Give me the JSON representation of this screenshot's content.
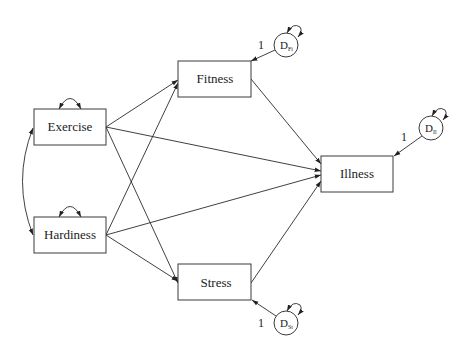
{
  "diagram": {
    "type": "path_diagram",
    "nodes": {
      "exercise": {
        "label": "Exercise",
        "shape": "rectangle"
      },
      "hardiness": {
        "label": "Hardiness",
        "shape": "rectangle"
      },
      "fitness": {
        "label": "Fitness",
        "shape": "rectangle"
      },
      "stress": {
        "label": "Stress",
        "shape": "rectangle"
      },
      "illness": {
        "label": "Illness",
        "shape": "rectangle"
      }
    },
    "disturbances": {
      "d_fi": {
        "label": "D",
        "subscript": "Fi",
        "path_label": "1",
        "target": "Fitness"
      },
      "d_il": {
        "label": "D",
        "subscript": "Il",
        "path_label": "1",
        "target": "Illness"
      },
      "d_st": {
        "label": "D",
        "subscript": "St",
        "path_label": "1",
        "target": "Stress"
      }
    },
    "edges": [
      {
        "from": "Exercise",
        "to": "Fitness",
        "type": "directed"
      },
      {
        "from": "Exercise",
        "to": "Stress",
        "type": "directed"
      },
      {
        "from": "Exercise",
        "to": "Illness",
        "type": "directed"
      },
      {
        "from": "Hardiness",
        "to": "Fitness",
        "type": "directed"
      },
      {
        "from": "Hardiness",
        "to": "Stress",
        "type": "directed"
      },
      {
        "from": "Hardiness",
        "to": "Illness",
        "type": "directed"
      },
      {
        "from": "Fitness",
        "to": "Illness",
        "type": "directed"
      },
      {
        "from": "Stress",
        "to": "Illness",
        "type": "directed"
      },
      {
        "from": "Exercise",
        "to": "Hardiness",
        "type": "covariance"
      }
    ],
    "variances": [
      "Exercise",
      "Hardiness",
      "D_Fi",
      "D_Il",
      "D_St"
    ]
  }
}
